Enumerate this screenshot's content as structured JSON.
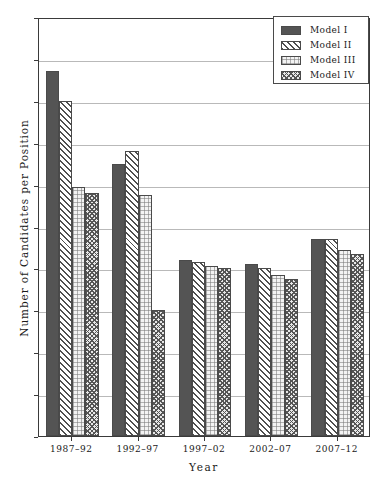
{
  "chart_data": {
    "type": "bar",
    "title": "",
    "xlabel": "Year",
    "ylabel": "Number of Candidates per Position",
    "ylim": [
      0.0,
      2.0
    ],
    "ytick_step": 0.2,
    "grid": true,
    "legend_position": "top-right",
    "categories": [
      "1987–92",
      "1992–97",
      "1997–02",
      "2002–07",
      "2007–12"
    ],
    "ytick_labels": [
      "0.0",
      "0.2",
      "0.4",
      "0.6",
      "0.8",
      "1.0",
      "1.2",
      "1.4",
      "1.6",
      "1.8",
      "2.0"
    ],
    "series": [
      {
        "name": "Model I",
        "pattern": "solid-dark",
        "values": [
          1.74,
          1.3,
          0.84,
          0.82,
          0.94
        ]
      },
      {
        "name": "Model II",
        "pattern": "diagonal-hatch",
        "values": [
          1.6,
          1.36,
          0.83,
          0.8,
          0.94
        ]
      },
      {
        "name": "Model III",
        "pattern": "light-dotted",
        "values": [
          1.19,
          1.15,
          0.81,
          0.77,
          0.89
        ]
      },
      {
        "name": "Model IV",
        "pattern": "cross-hatch",
        "values": [
          1.16,
          0.6,
          0.8,
          0.75,
          0.87
        ]
      }
    ]
  },
  "legend": {
    "items": [
      {
        "label": "Model I"
      },
      {
        "label": "Model II"
      },
      {
        "label": "Model III"
      },
      {
        "label": "Model IV"
      }
    ]
  },
  "colors": {
    "model1": "#545454",
    "model2": "#4f4f4f",
    "model3": "#f3f3f3",
    "model4": "#555555",
    "axis": "#3a3a3a",
    "grid": "#b9b9b9",
    "background": "#ffffff"
  }
}
